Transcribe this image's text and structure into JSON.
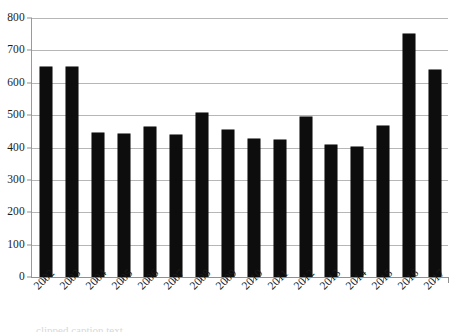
{
  "chart_data": {
    "type": "bar",
    "title": "",
    "xlabel": "",
    "ylabel": "",
    "categories": [
      "2002",
      "2003",
      "2004",
      "2005",
      "2006",
      "2007",
      "2008",
      "2009",
      "2010",
      "2011",
      "2012",
      "2013",
      "2014",
      "2015",
      "2016",
      "2017"
    ],
    "values": [
      648,
      650,
      446,
      443,
      463,
      440,
      506,
      454,
      426,
      424,
      494,
      407,
      403,
      468,
      752,
      640
    ],
    "ylim": [
      0,
      800
    ],
    "ytick_labels": [
      "800",
      "700",
      "600",
      "500",
      "400",
      "300",
      "200",
      "100",
      "0"
    ],
    "ytick_values": [
      800,
      700,
      600,
      500,
      400,
      300,
      200,
      100,
      0
    ],
    "ytick_interval": 100,
    "grid": "horizontal",
    "legend": "none",
    "series": [
      {
        "name": "",
        "color": "#0d0d0d",
        "values": [
          648,
          650,
          446,
          443,
          463,
          440,
          506,
          454,
          426,
          424,
          494,
          407,
          403,
          468,
          752,
          640
        ]
      }
    ],
    "annotations": [],
    "xlabel_rotation": -45
  },
  "style": {
    "bar_color": "#0d0d0d",
    "gridline_color": "#b6b6b6",
    "axis_color": "#8f8f8f",
    "background": "#ffffff",
    "text_color": "#1c1c1c"
  },
  "caption": {
    "clipped_text": "clipped caption text"
  }
}
